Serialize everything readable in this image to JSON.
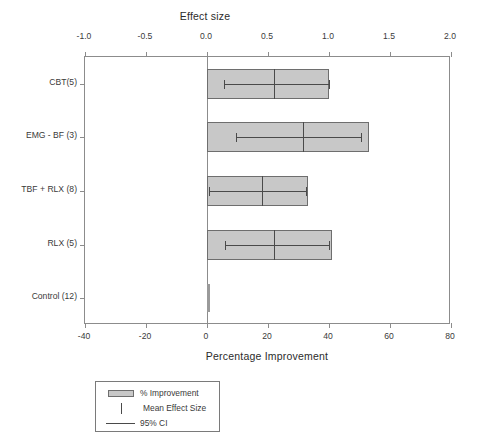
{
  "chart_data": {
    "type": "bar",
    "title": "",
    "top_axis": {
      "label": "Effect size",
      "ticks": [
        "-1.0",
        "-0.5",
        "0.0",
        "0.5",
        "1.0",
        "1.5",
        "2.0"
      ],
      "tick_values": [
        -1.0,
        -0.5,
        0.0,
        0.5,
        1.0,
        1.5,
        2.0
      ],
      "range": [
        -1.0,
        2.0
      ]
    },
    "bottom_axis": {
      "label": "Percentage Improvement",
      "ticks": [
        "-40",
        "-20",
        "0",
        "20",
        "40",
        "60",
        "80"
      ],
      "tick_values": [
        -40,
        -20,
        0,
        20,
        40,
        60,
        80
      ],
      "range": [
        -40,
        80
      ]
    },
    "categories": [
      "CBT(5)",
      "EMG - BF (3)",
      "TBF + RLX (8)",
      "RLX (5)",
      "Control (12)"
    ],
    "grid": false,
    "legend_position": "below-plot",
    "series": [
      {
        "name": "% Improvement",
        "axis": "bottom",
        "values": [
          40,
          53,
          33,
          41,
          0
        ]
      },
      {
        "name": "Mean Effect Size",
        "axis": "top",
        "values": [
          0.55,
          0.79,
          0.45,
          0.55,
          null
        ]
      },
      {
        "name": "95% CI",
        "axis": "top",
        "lower": [
          0.14,
          0.24,
          0.02,
          0.15,
          null
        ],
        "upper": [
          1.0,
          1.26,
          0.81,
          1.0,
          null
        ]
      }
    ],
    "rows": [
      {
        "category": "CBT(5)",
        "improvement": 40,
        "mean_effect_size": 0.55,
        "ci_low": 0.14,
        "ci_high": 1.0
      },
      {
        "category": "EMG - BF (3)",
        "improvement": 53,
        "mean_effect_size": 0.79,
        "ci_low": 0.24,
        "ci_high": 1.26
      },
      {
        "category": "TBF + RLX (8)",
        "improvement": 33,
        "mean_effect_size": 0.45,
        "ci_low": 0.02,
        "ci_high": 0.81
      },
      {
        "category": "RLX (5)",
        "improvement": 41,
        "mean_effect_size": 0.55,
        "ci_low": 0.15,
        "ci_high": 1.0
      },
      {
        "category": "Control (12)",
        "improvement": 0,
        "mean_effect_size": null,
        "ci_low": null,
        "ci_high": null
      }
    ],
    "legend": [
      {
        "key": "swatch",
        "label": "% Improvement"
      },
      {
        "key": "tick",
        "label": "Mean Effect Size"
      },
      {
        "key": "line",
        "label": "95% CI"
      }
    ],
    "colors": {
      "bar_fill": "#c8c8c8",
      "bar_border": "#6e6e6e",
      "marker": "#4a4a4a",
      "axis": "#8c8c8c",
      "text": "#3a3a3a",
      "background": "#ffffff"
    }
  }
}
